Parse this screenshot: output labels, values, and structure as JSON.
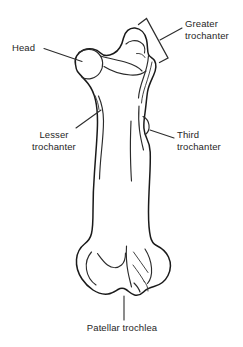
{
  "figure": {
    "view": "posterior",
    "background_color": "#ffffff",
    "line_color": "#1a1a1a",
    "text_color": "#262626"
  },
  "labels": {
    "head": {
      "text": "Head",
      "lines": [
        "Head"
      ]
    },
    "greater_trochanter": {
      "text": "Greater trochanter",
      "line1": "Greater",
      "line2": "trochanter"
    },
    "lesser_trochanter": {
      "text": "Lesser trochanter",
      "line1": "Lesser",
      "line2": "trochanter"
    },
    "third_trochanter": {
      "text": "Third trochanter",
      "line1": "Third",
      "line2": "trochanter"
    },
    "patellar_trochlea": {
      "text": "Patellar trochlea",
      "lines": [
        "Patellar trochlea"
      ]
    }
  },
  "annotations": {
    "head_leader": "leader line from Head label to femoral head",
    "greater_leader": "leader line from Greater trochanter label to bracket",
    "greater_bracket": "angled square bracket spanning greater trochanter",
    "lesser_leader": "leader line from Lesser trochanter label to lesser trochanter",
    "third_leader": "leader line from Third trochanter label to third trochanter",
    "patellar_leader": "vertical leader line from Patellar trochlea label to trochlea"
  }
}
